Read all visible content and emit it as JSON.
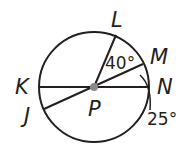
{
  "diagram": {
    "center_label": "P",
    "points": {
      "L": "L",
      "M": "M",
      "N": "N",
      "K": "K",
      "J": "J"
    },
    "angles": {
      "LPM": "40°",
      "MPN": "25°"
    },
    "colors": {
      "stroke": "#231f20",
      "center_dot": "#8a8a8a"
    }
  }
}
